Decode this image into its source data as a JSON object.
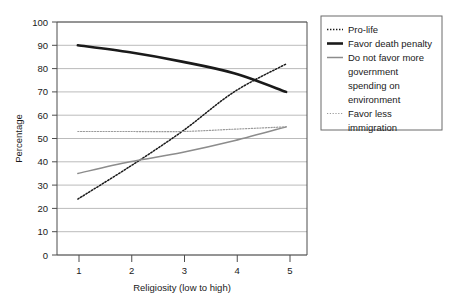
{
  "chart_data": {
    "type": "line",
    "title": "",
    "xlabel": "Religiosity (low to high)",
    "ylabel": "Percentage",
    "x": [
      1,
      2,
      3,
      4,
      5
    ],
    "xtick_labels": [
      "1",
      "2",
      "3",
      "4",
      "5"
    ],
    "ytick_labels": [
      "0",
      "10",
      "20",
      "30",
      "40",
      "50",
      "60",
      "70",
      "80",
      "90",
      "100"
    ],
    "xlim": [
      0.6,
      5.4
    ],
    "ylim": [
      0,
      100
    ],
    "grid": "horizontal",
    "legend_position": "right-top",
    "series": [
      {
        "name": "Pro-life",
        "values": [
          24,
          38,
          53,
          70,
          82
        ],
        "style": "dotted",
        "color": "#1a1a1a",
        "width": 1.5
      },
      {
        "name": "Favor death penalty",
        "values": [
          90,
          87,
          83,
          78,
          70
        ],
        "style": "solid",
        "color": "#1a1a1a",
        "width": 2.6
      },
      {
        "name": "Do not favor more government spending on environment",
        "values": [
          35,
          40,
          44,
          49,
          55
        ],
        "style": "solid",
        "color": "#8c8c8c",
        "width": 1.5
      },
      {
        "name": "Favor less immigration",
        "values": [
          53,
          53,
          53,
          54,
          55
        ],
        "style": "dotted",
        "color": "#9a9a9a",
        "width": 1.2
      }
    ]
  },
  "legend": {
    "entries": [
      {
        "label": "Pro-life"
      },
      {
        "label": "Favor death penalty"
      },
      {
        "label": "Do not favor more"
      },
      {
        "label": "government"
      },
      {
        "label": "spending on"
      },
      {
        "label": "environment"
      },
      {
        "label": "Favor less"
      },
      {
        "label": "immigration"
      }
    ]
  },
  "colors": {
    "axis": "#4d4d4d",
    "grid": "#9e9e9e",
    "dark_line": "#1a1a1a",
    "gray_line": "#8c8c8c",
    "light_gray_line": "#9a9a9a",
    "legend_border": "#6b6b6b",
    "text": "#1a1a1a",
    "background": "#ffffff"
  }
}
